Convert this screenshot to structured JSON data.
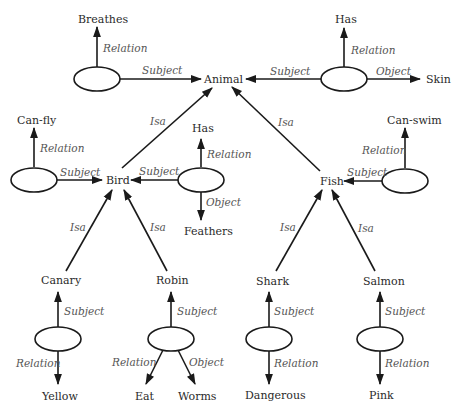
{
  "diagram": {
    "type": "semantic-network",
    "nodes": {
      "animal": "Animal",
      "breathes": "Breathes",
      "has_top": "Has",
      "skin": "Skin",
      "can_fly": "Can-fly",
      "bird": "Bird",
      "has_bird": "Has",
      "feathers": "Feathers",
      "fish": "Fish",
      "can_swim": "Can-swim",
      "canary": "Canary",
      "robin": "Robin",
      "shark": "Shark",
      "salmon": "Salmon",
      "yellow": "Yellow",
      "eat": "Eat",
      "worms": "Worms",
      "dangerous": "Dangerous",
      "pink": "Pink"
    },
    "edge_labels": {
      "relation": "Relation",
      "subject": "Subject",
      "object": "Object",
      "isa": "Isa"
    },
    "edges": [
      {
        "from": "prop-breathes",
        "to": "Animal",
        "label": "Subject"
      },
      {
        "from": "prop-breathes",
        "to": "Breathes",
        "label": "Relation"
      },
      {
        "from": "prop-has-skin",
        "to": "Animal",
        "label": "Subject"
      },
      {
        "from": "prop-has-skin",
        "to": "Has",
        "label": "Relation"
      },
      {
        "from": "prop-has-skin",
        "to": "Skin",
        "label": "Object"
      },
      {
        "from": "Bird",
        "to": "Animal",
        "label": "Isa"
      },
      {
        "from": "Fish",
        "to": "Animal",
        "label": "Isa"
      },
      {
        "from": "prop-can-fly",
        "to": "Bird",
        "label": "Subject"
      },
      {
        "from": "prop-can-fly",
        "to": "Can-fly",
        "label": "Relation"
      },
      {
        "from": "prop-has-feathers",
        "to": "Bird",
        "label": "Subject"
      },
      {
        "from": "prop-has-feathers",
        "to": "Has",
        "label": "Relation"
      },
      {
        "from": "prop-has-feathers",
        "to": "Feathers",
        "label": "Object"
      },
      {
        "from": "prop-can-swim",
        "to": "Fish",
        "label": "Subject"
      },
      {
        "from": "prop-can-swim",
        "to": "Can-swim",
        "label": "Relation"
      },
      {
        "from": "Canary",
        "to": "Bird",
        "label": "Isa"
      },
      {
        "from": "Robin",
        "to": "Bird",
        "label": "Isa"
      },
      {
        "from": "Shark",
        "to": "Fish",
        "label": "Isa"
      },
      {
        "from": "Salmon",
        "to": "Fish",
        "label": "Isa"
      },
      {
        "from": "prop-canary-yellow",
        "to": "Canary",
        "label": "Subject"
      },
      {
        "from": "prop-canary-yellow",
        "to": "Yellow",
        "label": "Relation"
      },
      {
        "from": "prop-robin-eat",
        "to": "Robin",
        "label": "Subject"
      },
      {
        "from": "prop-robin-eat",
        "to": "Eat",
        "label": "Relation"
      },
      {
        "from": "prop-robin-eat",
        "to": "Worms",
        "label": "Object"
      },
      {
        "from": "prop-shark-dangerous",
        "to": "Shark",
        "label": "Subject"
      },
      {
        "from": "prop-shark-dangerous",
        "to": "Dangerous",
        "label": "Relation"
      },
      {
        "from": "prop-salmon-pink",
        "to": "Salmon",
        "label": "Subject"
      },
      {
        "from": "prop-salmon-pink",
        "to": "Pink",
        "label": "Relation"
      }
    ]
  }
}
